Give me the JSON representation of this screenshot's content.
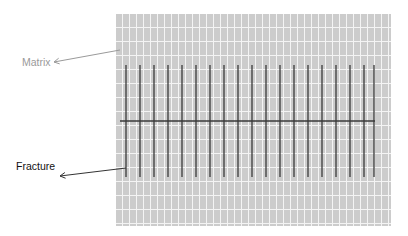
{
  "diagram": {
    "type": "fracture-matrix-schematic",
    "labels": {
      "matrix": {
        "text": "Matrix",
        "x": 22,
        "y": 57,
        "color": "#9a9a9a"
      },
      "fracture": {
        "text": "Fracture",
        "x": 16,
        "y": 161,
        "color": "#111111"
      }
    },
    "matrix_grid": {
      "x": 116,
      "y": 14,
      "width": 275,
      "height": 212,
      "fill": "#cccccc",
      "grid_line_color": "#f4f4f4",
      "vertical_spacing": 7,
      "horizontal_spacing": 14
    },
    "fractures": {
      "color": "#3a3a3a",
      "vertical": {
        "x_positions": [
          126,
          140,
          154,
          168,
          182,
          196,
          210,
          224,
          238,
          252,
          266,
          280,
          294,
          308,
          322,
          336,
          350,
          364,
          374
        ],
        "y_start": 65,
        "y_end": 177,
        "width": 1.3
      },
      "horizontal": {
        "x_start": 120,
        "x_end": 375,
        "y": 121,
        "width": 1.3
      }
    },
    "arrows": [
      {
        "name": "matrix-arrow",
        "from": [
          120,
          50
        ],
        "to": [
          54,
          62
        ],
        "color": "#9a9a9a"
      },
      {
        "name": "fracture-arrow",
        "from": [
          126,
          168
        ],
        "to": [
          60,
          176
        ],
        "color": "#333333"
      }
    ]
  }
}
